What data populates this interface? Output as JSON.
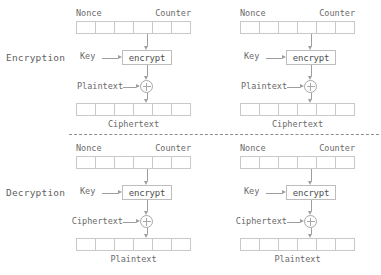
{
  "diagram": {
    "type": "block-diagram",
    "ink_color": "#5a5a5a",
    "line_color": "#9e9e9e",
    "cell_border_color": "#c9c9c9"
  },
  "sections": [
    {
      "id": "encryption",
      "label": "Encryption",
      "blocks": [
        {
          "id": "encryption-block-1",
          "register_cells": 6,
          "top_left_caption": "Nonce",
          "top_right_caption": "Counter",
          "key_label": "Key",
          "cipher_label": "encrypt",
          "xor_input_label": "Plaintext",
          "bottom_caption": "Ciphertext"
        },
        {
          "id": "encryption-block-2",
          "register_cells": 6,
          "top_left_caption": "Nonce",
          "top_right_caption": "Counter",
          "key_label": "Key",
          "cipher_label": "encrypt",
          "xor_input_label": "Plaintext",
          "bottom_caption": "Ciphertext"
        }
      ]
    },
    {
      "id": "decryption",
      "label": "Decryption",
      "blocks": [
        {
          "id": "decryption-block-1",
          "register_cells": 6,
          "top_left_caption": "Nonce",
          "top_right_caption": "Counter",
          "key_label": "Key",
          "cipher_label": "encrypt",
          "xor_input_label": "Ciphertext",
          "bottom_caption": "Plaintext"
        },
        {
          "id": "decryption-block-2",
          "register_cells": 6,
          "top_left_caption": "Nonce",
          "top_right_caption": "Counter",
          "key_label": "Key",
          "cipher_label": "encrypt",
          "xor_input_label": "Ciphertext",
          "bottom_caption": "Plaintext"
        }
      ]
    }
  ]
}
